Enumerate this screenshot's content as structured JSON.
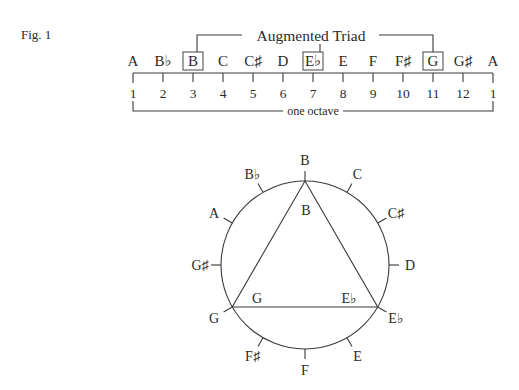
{
  "figure": {
    "label": "Fig. 1",
    "bracket_title": "Augmented Triad",
    "octave_label": "one octave"
  },
  "scale": {
    "notes": [
      {
        "name": "A",
        "pos": 1,
        "boxed": false
      },
      {
        "name": "B♭",
        "pos": 2,
        "boxed": false
      },
      {
        "name": "B",
        "pos": 3,
        "boxed": true
      },
      {
        "name": "C",
        "pos": 4,
        "boxed": false
      },
      {
        "name": "C♯",
        "pos": 5,
        "boxed": false
      },
      {
        "name": "D",
        "pos": 6,
        "boxed": false
      },
      {
        "name": "E♭",
        "pos": 7,
        "boxed": true
      },
      {
        "name": "E",
        "pos": 8,
        "boxed": false
      },
      {
        "name": "F",
        "pos": 9,
        "boxed": false
      },
      {
        "name": "F♯",
        "pos": 10,
        "boxed": false
      },
      {
        "name": "G",
        "pos": 11,
        "boxed": true
      },
      {
        "name": "G♯",
        "pos": 12,
        "boxed": false
      },
      {
        "name": "A",
        "pos": 1,
        "boxed": false
      }
    ]
  },
  "circle": {
    "notes": [
      "B",
      "C",
      "C♯",
      "D",
      "E♭",
      "E",
      "F",
      "F♯",
      "G",
      "G♯",
      "A",
      "B♭"
    ],
    "triad_vertices": [
      "B",
      "E♭",
      "G"
    ],
    "inner_labels": [
      "B",
      "G",
      "E♭"
    ]
  },
  "colors": {
    "ink": "#2a2a2a",
    "background": "#ffffff"
  }
}
